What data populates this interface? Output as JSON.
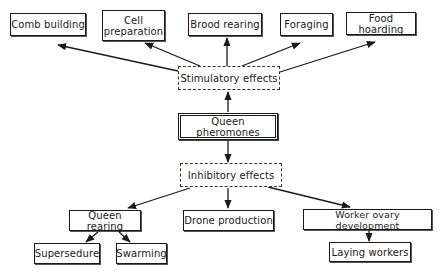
{
  "diagram": {
    "central_node": "Queen pheromones",
    "stimulatory": {
      "label": "Stimulatory effects",
      "effects": [
        "Comb building",
        "Cell preparation",
        "Brood rearing",
        "Foraging",
        "Food hoarding"
      ]
    },
    "inhibitory": {
      "label": "Inhibitory effects",
      "effects": [
        "Queen rearing",
        "Drone production",
        "Worker ovary development"
      ],
      "queen_rearing_children": [
        "Supersedure",
        "Swarming"
      ],
      "worker_ovary_children": [
        "Laying workers"
      ]
    }
  },
  "colors": {
    "line": "#1a1a1a",
    "background": "#ffffff"
  }
}
